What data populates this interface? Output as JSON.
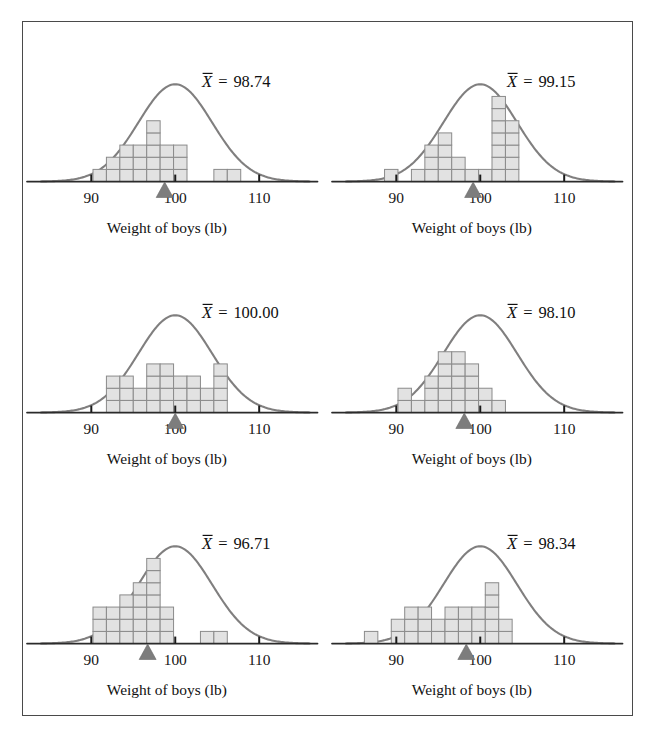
{
  "figure": {
    "border_color": "#4a4a4a",
    "background": "#ffffff",
    "curve_color": "#807f7f",
    "bar_fill": "#e2e2e2",
    "bar_stroke": "#8a8a8a",
    "marker_color": "#7d7d7d",
    "axis_color": "#2b2b2b"
  },
  "common": {
    "caption": "Weight of boys (lb)",
    "tick_labels": [
      "90",
      "100",
      "110"
    ],
    "tick_values": [
      90,
      100,
      110
    ],
    "mean_symbol": "X",
    "equals": "=",
    "x_axis_min": 84,
    "x_axis_max": 116
  },
  "chart_data": [
    {
      "type": "bar",
      "title": "",
      "panel_index": 1,
      "mean_label": "98.74",
      "mean_value": 98.74,
      "xlabel": "Weight of boys (lb)",
      "ylabel": "",
      "xlim": [
        84,
        116
      ],
      "ylim": [
        0,
        8
      ],
      "grid": false,
      "bin_width": 1.6,
      "categories": [
        91.0,
        92.6,
        94.2,
        95.8,
        97.4,
        99.0,
        100.6,
        105.4,
        107.0
      ],
      "values": [
        1,
        2,
        3,
        3,
        5,
        3,
        3,
        1,
        1
      ],
      "curve": {
        "mean": 100.0,
        "sd": 4.4,
        "peak_units": 8.0
      },
      "marker_x": 98.74
    },
    {
      "type": "bar",
      "title": "",
      "panel_index": 2,
      "mean_label": "99.15",
      "mean_value": 99.15,
      "xlabel": "Weight of boys (lb)",
      "ylabel": "",
      "xlim": [
        84,
        116
      ],
      "ylim": [
        0,
        8
      ],
      "grid": false,
      "bin_width": 1.6,
      "categories": [
        89.4,
        92.6,
        94.2,
        95.8,
        97.4,
        99.0,
        100.6,
        102.2,
        103.8
      ],
      "values": [
        1,
        1,
        3,
        4,
        2,
        1,
        1,
        7,
        5
      ],
      "curve": {
        "mean": 100.0,
        "sd": 4.4,
        "peak_units": 8.0
      },
      "marker_x": 99.15
    },
    {
      "type": "bar",
      "title": "",
      "panel_index": 3,
      "mean_label": "100.00",
      "mean_value": 100.0,
      "xlabel": "Weight of boys (lb)",
      "ylabel": "",
      "xlim": [
        84,
        116
      ],
      "ylim": [
        0,
        8
      ],
      "grid": false,
      "bin_width": 1.6,
      "categories": [
        92.6,
        94.2,
        95.8,
        97.4,
        99.0,
        100.6,
        102.2,
        103.8,
        105.4
      ],
      "values": [
        3,
        3,
        2,
        4,
        4,
        3,
        3,
        2,
        4
      ],
      "curve": {
        "mean": 100.0,
        "sd": 4.4,
        "peak_units": 8.0
      },
      "marker_x": 100.0
    },
    {
      "type": "bar",
      "title": "",
      "panel_index": 4,
      "mean_label": "98.10",
      "mean_value": 98.1,
      "xlabel": "Weight of boys (lb)",
      "ylabel": "",
      "xlim": [
        84,
        116
      ],
      "ylim": [
        0,
        8
      ],
      "grid": false,
      "bin_width": 1.6,
      "categories": [
        91.0,
        92.6,
        94.2,
        95.8,
        97.4,
        99.0,
        100.6,
        102.2
      ],
      "values": [
        2,
        1,
        3,
        5,
        5,
        4,
        2,
        1
      ],
      "curve": {
        "mean": 100.0,
        "sd": 4.4,
        "peak_units": 8.0
      },
      "marker_x": 98.1
    },
    {
      "type": "bar",
      "title": "",
      "panel_index": 5,
      "mean_label": "96.71",
      "mean_value": 96.71,
      "xlabel": "Weight of boys (lb)",
      "ylabel": "",
      "xlim": [
        84,
        116
      ],
      "ylim": [
        0,
        8
      ],
      "grid": false,
      "bin_width": 1.6,
      "categories": [
        91.0,
        92.6,
        94.2,
        95.8,
        97.4,
        99.0,
        103.8,
        105.4
      ],
      "values": [
        3,
        3,
        4,
        5,
        7,
        3,
        1,
        1
      ],
      "curve": {
        "mean": 100.0,
        "sd": 4.4,
        "peak_units": 8.0
      },
      "marker_x": 96.71
    },
    {
      "type": "bar",
      "title": "",
      "panel_index": 6,
      "mean_label": "98.34",
      "mean_value": 98.34,
      "xlabel": "Weight of boys (lb)",
      "ylabel": "",
      "xlim": [
        84,
        116
      ],
      "ylim": [
        0,
        8
      ],
      "grid": false,
      "bin_width": 1.6,
      "categories": [
        87.0,
        90.2,
        91.8,
        93.4,
        95.0,
        96.6,
        98.2,
        99.8,
        101.4,
        103.0
      ],
      "values": [
        1,
        2,
        3,
        3,
        2,
        3,
        3,
        3,
        5,
        2
      ],
      "curve": {
        "mean": 100.0,
        "sd": 4.4,
        "peak_units": 8.0
      },
      "marker_x": 98.34
    }
  ]
}
